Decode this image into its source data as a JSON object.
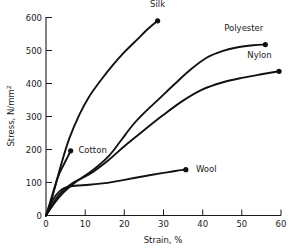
{
  "chart_data": {
    "type": "line",
    "title": "",
    "xlabel": "Strain, %",
    "ylabel": "Stress, N/mm",
    "ylabel_sup": "2",
    "xlim": [
      0,
      60
    ],
    "ylim": [
      0,
      600
    ],
    "xticks": [
      0,
      10,
      20,
      30,
      40,
      50,
      60
    ],
    "yticks": [
      0,
      100,
      200,
      300,
      400,
      500,
      600
    ],
    "xtick_labels": [
      "0",
      "10",
      "20",
      "30",
      "40",
      "50",
      "60"
    ],
    "ytick_labels": [
      "0",
      "100",
      "200",
      "300",
      "400",
      "500",
      "600"
    ],
    "grid": false,
    "legend_position": "inline-end-of-curve",
    "series": [
      {
        "name": "Silk",
        "label": "Silk",
        "label_x": 28.5,
        "label_y": 640,
        "endpoint": [
          28.5,
          590
        ],
        "points": [
          [
            0,
            0
          ],
          [
            1.2,
            40
          ],
          [
            2.5,
            95
          ],
          [
            4,
            160
          ],
          [
            6,
            235
          ],
          [
            8.5,
            305
          ],
          [
            11,
            360
          ],
          [
            14,
            410
          ],
          [
            17,
            455
          ],
          [
            20,
            495
          ],
          [
            23,
            530
          ],
          [
            26,
            565
          ],
          [
            28.5,
            590
          ]
        ]
      },
      {
        "name": "Polyester",
        "label": "Polyester",
        "label_x": 50.5,
        "label_y": 567,
        "endpoint": [
          56,
          518
        ],
        "points": [
          [
            0,
            0
          ],
          [
            2,
            35
          ],
          [
            4.5,
            70
          ],
          [
            8,
            105
          ],
          [
            12,
            138
          ],
          [
            16,
            180
          ],
          [
            19,
            225
          ],
          [
            22,
            272
          ],
          [
            25,
            310
          ],
          [
            29,
            355
          ],
          [
            33,
            400
          ],
          [
            37,
            443
          ],
          [
            41,
            478
          ],
          [
            45,
            498
          ],
          [
            49,
            510
          ],
          [
            53,
            516
          ],
          [
            56,
            518
          ]
        ]
      },
      {
        "name": "Nylon",
        "label": "Nylon",
        "label_x": 54.5,
        "label_y": 487,
        "endpoint": [
          59.5,
          437
        ],
        "points": [
          [
            0,
            0
          ],
          [
            1.5,
            30
          ],
          [
            3,
            58
          ],
          [
            5,
            82
          ],
          [
            7,
            100
          ],
          [
            9,
            112
          ],
          [
            12,
            132
          ],
          [
            16,
            168
          ],
          [
            20,
            210
          ],
          [
            25,
            258
          ],
          [
            30,
            305
          ],
          [
            35,
            348
          ],
          [
            40,
            382
          ],
          [
            45,
            403
          ],
          [
            50,
            417
          ],
          [
            55,
            428
          ],
          [
            59.5,
            437
          ]
        ]
      },
      {
        "name": "Cotton",
        "label": "Cotton",
        "label_x": 7.5,
        "label_y": 197,
        "endpoint": [
          6.3,
          196
        ]
      },
      {
        "name": "Wool",
        "label": "Wool",
        "label_x": 37.5,
        "label_y": 140,
        "endpoint": [
          35.7,
          139
        ],
        "points": [
          [
            0,
            0
          ],
          [
            1,
            28
          ],
          [
            2,
            52
          ],
          [
            3.2,
            70
          ],
          [
            4.5,
            82
          ],
          [
            6,
            88
          ],
          [
            8,
            91
          ],
          [
            11,
            93
          ],
          [
            15,
            98
          ],
          [
            20,
            108
          ],
          [
            25,
            119
          ],
          [
            30,
            129
          ],
          [
            33,
            135
          ],
          [
            35.7,
            139
          ]
        ]
      }
    ],
    "cotton_points": [
      [
        0,
        0
      ],
      [
        1,
        38
      ],
      [
        2,
        78
      ],
      [
        3,
        115
      ],
      [
        4,
        142
      ],
      [
        5,
        165
      ],
      [
        5.8,
        184
      ],
      [
        6.3,
        196
      ]
    ]
  }
}
